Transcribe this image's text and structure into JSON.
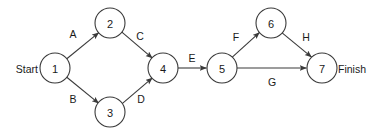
{
  "diagram": {
    "type": "activity-on-arrow-network",
    "canvas": {
      "width": 374,
      "height": 136,
      "background": "#ffffff"
    },
    "style": {
      "line_color": "#3a3a3a",
      "node_fill": "#ffffff",
      "text_color": "#1a1a1a",
      "node_radius": 15
    },
    "terminals": {
      "start": {
        "label": "Start",
        "x": 34,
        "y": 68
      },
      "finish": {
        "label": "Finish",
        "x": 340,
        "y": 68
      }
    },
    "nodes": [
      {
        "id": "n1",
        "label": "1",
        "cx": 55,
        "cy": 68
      },
      {
        "id": "n2",
        "label": "2",
        "cx": 110,
        "cy": 23
      },
      {
        "id": "n3",
        "label": "3",
        "cx": 110,
        "cy": 112
      },
      {
        "id": "n4",
        "label": "4",
        "cx": 163,
        "cy": 68
      },
      {
        "id": "n5",
        "label": "5",
        "cx": 222,
        "cy": 68
      },
      {
        "id": "n6",
        "label": "6",
        "cx": 271,
        "cy": 23
      },
      {
        "id": "n7",
        "label": "7",
        "cx": 322,
        "cy": 68
      }
    ],
    "edges": [
      {
        "id": "eA",
        "label": "A",
        "from": "n1",
        "to": "n2",
        "label_x": 73,
        "label_y": 34
      },
      {
        "id": "eB",
        "label": "B",
        "from": "n1",
        "to": "n3",
        "label_x": 73,
        "label_y": 99
      },
      {
        "id": "eC",
        "label": "C",
        "from": "n2",
        "to": "n4",
        "label_x": 140,
        "label_y": 36
      },
      {
        "id": "eD",
        "label": "D",
        "from": "n3",
        "to": "n4",
        "label_x": 141,
        "label_y": 99
      },
      {
        "id": "eE",
        "label": "E",
        "from": "n4",
        "to": "n5",
        "label_x": 192,
        "label_y": 58
      },
      {
        "id": "eF",
        "label": "F",
        "from": "n5",
        "to": "n6",
        "label_x": 236,
        "label_y": 37
      },
      {
        "id": "eG",
        "label": "G",
        "from": "n5",
        "to": "n7",
        "label_x": 272,
        "label_y": 82
      },
      {
        "id": "eH",
        "label": "H",
        "from": "n6",
        "to": "n7",
        "label_x": 306,
        "label_y": 37
      }
    ]
  }
}
